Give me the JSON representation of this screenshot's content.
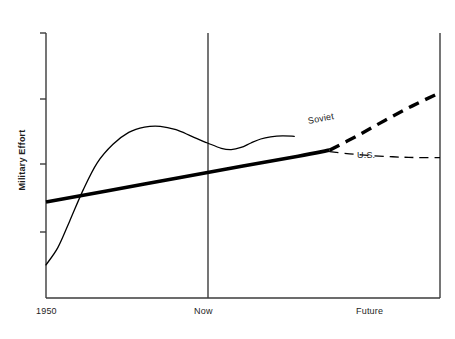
{
  "chart_data": {
    "type": "line",
    "title": "",
    "subtitle": "",
    "xlabel": "",
    "ylabel": "Military Effort",
    "grid": false,
    "legend_position": "inline-annotations",
    "axis": {
      "x_ticks": [
        "1950",
        "Now",
        "Future"
      ],
      "x_tick_positions": [
        0.0,
        0.41,
        0.85
      ],
      "y_ticks": [],
      "y_tick_count": 4,
      "y_axis_unlabeled": true,
      "xlim": [
        0,
        1
      ],
      "ylim": [
        0,
        1
      ]
    },
    "annotations": [
      {
        "text": "Soviet",
        "x": 0.68,
        "y": 0.69,
        "rotation": -11
      },
      {
        "text": "U.S.",
        "x": 0.79,
        "y": 0.56,
        "rotation": 0
      }
    ],
    "series": [
      {
        "name": "historical-s-curve",
        "style": "solid-thin",
        "line_width": 1.3,
        "points": [
          [
            0.0,
            0.125
          ],
          [
            0.03,
            0.19
          ],
          [
            0.06,
            0.29
          ],
          [
            0.095,
            0.41
          ],
          [
            0.13,
            0.51
          ],
          [
            0.17,
            0.58
          ],
          [
            0.21,
            0.625
          ],
          [
            0.25,
            0.645
          ],
          [
            0.29,
            0.648
          ],
          [
            0.33,
            0.635
          ],
          [
            0.37,
            0.61
          ],
          [
            0.41,
            0.585
          ],
          [
            0.445,
            0.565
          ],
          [
            0.47,
            0.56
          ],
          [
            0.495,
            0.568
          ],
          [
            0.52,
            0.585
          ],
          [
            0.545,
            0.6
          ],
          [
            0.57,
            0.608
          ],
          [
            0.6,
            0.612
          ],
          [
            0.63,
            0.61
          ]
        ]
      },
      {
        "name": "trend-bold-solid",
        "style": "solid-bold",
        "line_width": 3.6,
        "points": [
          [
            0.0,
            0.362
          ],
          [
            0.25,
            0.43
          ],
          [
            0.5,
            0.498
          ],
          [
            0.64,
            0.535
          ],
          [
            0.72,
            0.558
          ]
        ]
      },
      {
        "name": "Soviet",
        "style": "dashed-bold",
        "line_width": 3.4,
        "dash": "11,7",
        "points": [
          [
            0.72,
            0.558
          ],
          [
            0.79,
            0.612
          ],
          [
            0.86,
            0.67
          ],
          [
            0.93,
            0.725
          ],
          [
            1.0,
            0.775
          ]
        ]
      },
      {
        "name": "U.S.",
        "style": "dashed-thin",
        "line_width": 1.3,
        "dash": "9,6",
        "points": [
          [
            0.72,
            0.552
          ],
          [
            0.8,
            0.54
          ],
          [
            0.88,
            0.533
          ],
          [
            0.94,
            0.53
          ],
          [
            1.0,
            0.53
          ]
        ]
      }
    ]
  },
  "xtick_labels": {
    "start": "1950",
    "now": "Now",
    "future": "Future"
  },
  "ylabel_text": "Military Effort",
  "series_labels": {
    "soviet": "Soviet",
    "us": "U.S."
  },
  "colors": {
    "axis": "#3b3b3b",
    "line": "#000000",
    "text": "#1e1e1e",
    "background": "#ffffff"
  }
}
